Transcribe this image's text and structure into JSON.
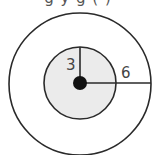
{
  "caption": {
    "text": "g y g  (    )"
  },
  "diagram": {
    "type": "concentric-circles",
    "colors": {
      "stroke": "#2a2a2a",
      "inner_fill": "#ebebeb",
      "outer_fill": "#ffffff",
      "center_dot": "#111111",
      "label": "#444444"
    },
    "outer_circle": {
      "cx": 80,
      "cy": 84,
      "r": 71
    },
    "inner_circle": {
      "cx": 80,
      "cy": 83,
      "r": 36
    },
    "center_point": {
      "cx": 80,
      "cy": 83,
      "r": 7
    },
    "inner_radius": {
      "label": "3",
      "direction": "up"
    },
    "outer_radius": {
      "label": "6",
      "direction": "right"
    }
  }
}
